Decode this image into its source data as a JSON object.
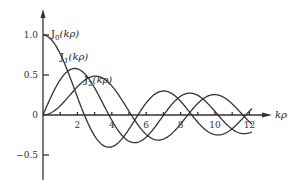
{
  "chart_data": {
    "type": "line",
    "title": "",
    "xlabel": "kρ",
    "ylabel": "",
    "xlim": [
      0,
      12.5
    ],
    "ylim": [
      -0.6,
      1.1
    ],
    "grid": false,
    "legend_position": "inline labels near curve peaks",
    "x_ticks": [
      2,
      4,
      6,
      8,
      10,
      12
    ],
    "x_minor_ticks": [
      1,
      3,
      5,
      7,
      9,
      11
    ],
    "y_ticks": [
      1.0,
      0.5,
      0,
      -0.5
    ],
    "x_tick_labels": [
      "2",
      "4",
      "6",
      "8",
      "10",
      "12"
    ],
    "y_tick_labels": [
      "1.0",
      "0.5",
      "0",
      "−0.5"
    ],
    "series": [
      {
        "name": "J0(kρ)",
        "label_main": "J",
        "label_sub": "0",
        "label_arg": "(kρ)",
        "function": "besselj0"
      },
      {
        "name": "J1(kρ)",
        "label_main": "J",
        "label_sub": "1",
        "label_arg": "(kρ)",
        "function": "besselj1"
      },
      {
        "name": "J2(kρ)",
        "label_main": "J",
        "label_sub": "2",
        "label_arg": "(kρ)",
        "function": "besselj2"
      }
    ]
  },
  "layout": {
    "origin_px": [
      43,
      115
    ],
    "px_per_x_unit": 17.2,
    "px_per_y_unit": 80,
    "curve_label_positions": [
      [
        51,
        37
      ],
      [
        60,
        60
      ],
      [
        84,
        83
      ]
    ]
  }
}
